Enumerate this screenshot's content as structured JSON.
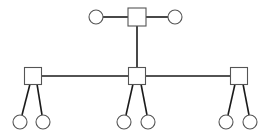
{
  "diagram": {
    "type": "tree",
    "colors": {
      "background": "#ffffff",
      "edge": "#1a1a1a",
      "node_stroke": "#555555",
      "node_fill": "#ffffff"
    },
    "nodes": [
      {
        "id": "root",
        "shape": "square",
        "cx": 137,
        "cy": 17,
        "size": 18
      },
      {
        "id": "root-l",
        "shape": "circle",
        "cx": 96,
        "cy": 17,
        "r": 7
      },
      {
        "id": "root-r",
        "shape": "circle",
        "cx": 175,
        "cy": 17,
        "r": 7
      },
      {
        "id": "left",
        "shape": "square",
        "cx": 33,
        "cy": 76,
        "size": 17
      },
      {
        "id": "mid",
        "shape": "square",
        "cx": 137,
        "cy": 76,
        "size": 17
      },
      {
        "id": "right",
        "shape": "square",
        "cx": 239,
        "cy": 76,
        "size": 17
      },
      {
        "id": "left-a",
        "shape": "circle",
        "cx": 20,
        "cy": 122,
        "r": 7
      },
      {
        "id": "left-b",
        "shape": "circle",
        "cx": 43,
        "cy": 122,
        "r": 7
      },
      {
        "id": "mid-a",
        "shape": "circle",
        "cx": 124,
        "cy": 122,
        "r": 7
      },
      {
        "id": "mid-b",
        "shape": "circle",
        "cx": 148,
        "cy": 122,
        "r": 7
      },
      {
        "id": "right-a",
        "shape": "circle",
        "cx": 226,
        "cy": 122,
        "r": 7
      },
      {
        "id": "right-b",
        "shape": "circle",
        "cx": 250,
        "cy": 122,
        "r": 7
      }
    ],
    "edges": [
      {
        "x1": 103,
        "y1": 17,
        "x2": 128,
        "y2": 17
      },
      {
        "x1": 146,
        "y1": 17,
        "x2": 168,
        "y2": 17
      },
      {
        "x1": 137,
        "y1": 26,
        "x2": 137,
        "y2": 67
      },
      {
        "x1": 41,
        "y1": 76,
        "x2": 128,
        "y2": 76
      },
      {
        "x1": 146,
        "y1": 76,
        "x2": 231,
        "y2": 76
      },
      {
        "x1": 30,
        "y1": 84,
        "x2": 22,
        "y2": 115
      },
      {
        "x1": 37,
        "y1": 84,
        "x2": 42,
        "y2": 115
      },
      {
        "x1": 133,
        "y1": 84,
        "x2": 126,
        "y2": 115
      },
      {
        "x1": 141,
        "y1": 84,
        "x2": 147,
        "y2": 115
      },
      {
        "x1": 235,
        "y1": 84,
        "x2": 228,
        "y2": 115
      },
      {
        "x1": 243,
        "y1": 84,
        "x2": 249,
        "y2": 115
      }
    ]
  }
}
